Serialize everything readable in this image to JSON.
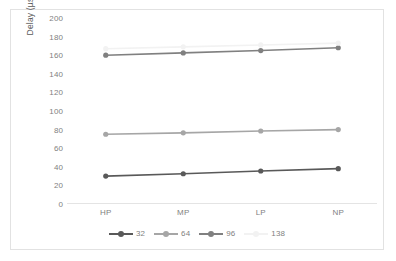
{
  "chart_data": {
    "type": "line",
    "title": "",
    "xlabel": "",
    "ylabel": "Delay (µs)",
    "categories": [
      "HP",
      "MP",
      "LP",
      "NP"
    ],
    "ylim": [
      0,
      200
    ],
    "yticks": [
      0,
      20,
      40,
      60,
      80,
      100,
      120,
      140,
      160,
      180,
      200
    ],
    "grid": false,
    "legend_position": "bottom",
    "series": [
      {
        "name": "32",
        "values": [
          30,
          32.5,
          35.5,
          38
        ],
        "color": "#595959"
      },
      {
        "name": "64",
        "values": [
          75,
          76.5,
          78.5,
          80
        ],
        "color": "#a6a6a6"
      },
      {
        "name": "96",
        "values": [
          160,
          162.5,
          165,
          168
        ],
        "color": "#808080"
      },
      {
        "name": "138",
        "values": [
          167,
          169,
          171,
          173
        ],
        "color": "#f2f2f2"
      }
    ]
  },
  "axis": {
    "y_title": "Delay (µs)",
    "y_tick_labels": [
      "200",
      "180",
      "160",
      "140",
      "120",
      "100",
      "80",
      "60",
      "40",
      "20",
      "0"
    ],
    "x_tick_labels": [
      "HP",
      "MP",
      "LP",
      "NP"
    ]
  },
  "legend": {
    "entries": [
      {
        "label": "32"
      },
      {
        "label": "64"
      },
      {
        "label": "96"
      },
      {
        "label": "138"
      }
    ]
  },
  "colors": {
    "border": "#e2e2e2",
    "axis": "#e4e4e4",
    "tick_text": "#7f7f7f",
    "title_text": "#595959",
    "background": "#ffffff"
  }
}
